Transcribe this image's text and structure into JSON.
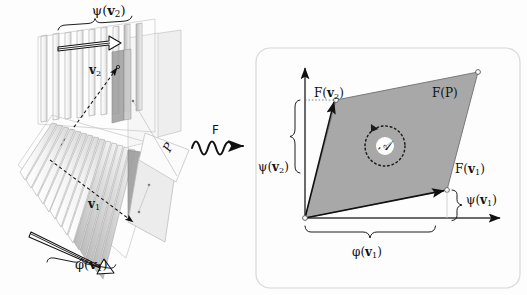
{
  "figure": {
    "type": "diagram",
    "background_color": "#fdfdfd",
    "ink_color": "#111111",
    "shaded_fill": "#a8a8a8",
    "plane_fill": "#e9e9e9"
  },
  "left_panel": {
    "name": "domain-panel",
    "description": "Two interleaved stacks of parallel planes (covector foliations) with vectors v1 and v2 spanning parallelogram P",
    "labels": {
      "psi_v2": "ψ(v₂)",
      "psi_v2_parts": {
        "fn": "ψ",
        "open": "(",
        "vec": "v",
        "sub": "2",
        "close": ")"
      },
      "phi_v1": "φ(v₁)",
      "phi_v1_parts": {
        "fn": "φ",
        "open": "(",
        "vec": "v",
        "sub": "1",
        "close": ")"
      },
      "v2": "v₂",
      "v2_parts": {
        "vec": "v",
        "sub": "2"
      },
      "v1": "v₁",
      "v1_parts": {
        "vec": "v",
        "sub": "1"
      },
      "p": "P"
    },
    "stacks": [
      {
        "name": "upper-stack",
        "covector": "ψ",
        "sheet_count": 9,
        "orientation": "near-vertical-sheets"
      },
      {
        "name": "lower-stack",
        "covector": "φ",
        "sheet_count": 14,
        "orientation": "tilted-sheets"
      }
    ]
  },
  "map_arrow": {
    "name": "wavy-map-arrow",
    "label": "F",
    "style": "squiggle-with-arrowhead",
    "direction": "left-to-right"
  },
  "right_panel": {
    "name": "codomain-panel",
    "border_style": "rounded-rectangle",
    "axes": {
      "x_label": "",
      "y_label": "",
      "origin_marker": "open-circle"
    },
    "labels": {
      "f_p": "F(P)",
      "f_v1": "F(v₁)",
      "f_v1_parts": {
        "fn": "F",
        "open": "(",
        "vec": "v",
        "sub": "1",
        "close": ")"
      },
      "f_v2": "F(v₂)",
      "f_v2_parts": {
        "fn": "F",
        "open": "(",
        "vec": "v",
        "sub": "2",
        "close": ")"
      },
      "area": "𝒜",
      "brace_left": "ψ(v₂)",
      "brace_left_parts": {
        "fn": "ψ",
        "open": "(",
        "vec": "v",
        "sub": "2",
        "close": ")"
      },
      "brace_right": "ψ(v₁)",
      "brace_right_parts": {
        "fn": "ψ",
        "open": "(",
        "vec": "v",
        "sub": "1",
        "close": ")"
      },
      "brace_bottom": "φ(v₁)",
      "brace_bottom_parts": {
        "fn": "φ",
        "open": "(",
        "vec": "v",
        "sub": "1",
        "close": ")"
      }
    },
    "parallelogram": {
      "name": "image-parallelogram",
      "fill": "#a8a8a8",
      "vertices_px": [
        [
          305,
          218
        ],
        [
          447,
          190
        ],
        [
          478,
          72
        ],
        [
          336,
          100
        ]
      ],
      "orientation_marker": "counterclockwise-dotted-circle-arrow"
    }
  }
}
